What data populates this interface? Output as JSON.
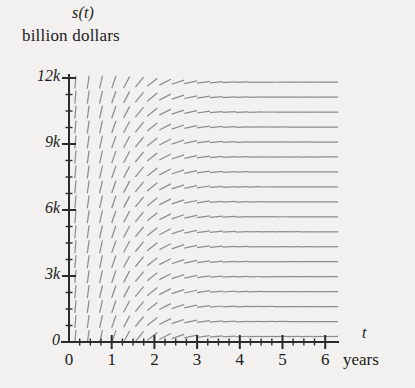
{
  "figure": {
    "kind": "slope-field",
    "y_axis_caption_line1": "s(t)",
    "y_axis_caption_line2": "billion dollars",
    "x_axis_caption_line1": "t",
    "x_axis_caption_line2": "years",
    "background_color": "#f2f1ef",
    "axis_color": "#2b2b2b",
    "segment_color": "#8d8d8d"
  },
  "chart_data": {
    "type": "scatter",
    "title": "",
    "subtitle": "",
    "xlabel": "t",
    "xlabel_units": "years",
    "ylabel": "s(t)",
    "ylabel_units": "billion dollars",
    "xlim": [
      0,
      6.2
    ],
    "ylim": [
      0,
      12000
    ],
    "grid": false,
    "legend": null,
    "x_ticks": [
      0,
      1,
      2,
      3,
      4,
      5,
      6
    ],
    "x_tick_labels": [
      "0",
      "1",
      "2",
      "3",
      "4",
      "5",
      "6"
    ],
    "x_minor_tick_step": 0.25,
    "y_ticks": [
      0,
      3000,
      6000,
      9000,
      12000
    ],
    "y_tick_labels": [
      "0",
      "3k",
      "6k",
      "9k",
      "12k"
    ],
    "y_minor_tick_step": 750,
    "field": {
      "description": "direction field of ds/dt; slopes steep near t=0 and flatten toward t=6",
      "t_start": 0.15,
      "t_end": 6.15,
      "t_step": 0.3,
      "s_start": 250,
      "s_end": 12000,
      "s_step": 680,
      "slope_model": "dsdt = A * exp(-k*t)",
      "A": 26000,
      "k": 1.45,
      "segment_length_px": 13
    }
  },
  "y_axis_ticks": [
    {
      "label": "12k",
      "value": 12000
    },
    {
      "label": "9k",
      "value": 9000
    },
    {
      "label": "6k",
      "value": 6000
    },
    {
      "label": "3k",
      "value": 3000
    },
    {
      "label": "0",
      "value": 0
    }
  ],
  "x_axis_ticks": [
    {
      "label": "0",
      "value": 0
    },
    {
      "label": "1",
      "value": 1
    },
    {
      "label": "2",
      "value": 2
    },
    {
      "label": "3",
      "value": 3
    },
    {
      "label": "4",
      "value": 4
    },
    {
      "label": "5",
      "value": 5
    },
    {
      "label": "6",
      "value": 6
    }
  ]
}
